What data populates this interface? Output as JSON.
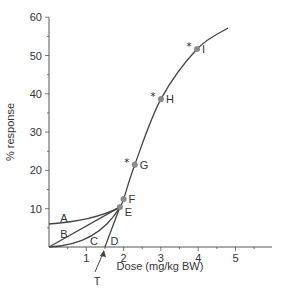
{
  "chart_data": {
    "type": "line",
    "title": "",
    "xlabel": "Dose (mg/kg BW)",
    "ylabel": "% response",
    "xlim": [
      0,
      6
    ],
    "ylim": [
      0,
      60
    ],
    "x_ticks": [
      1,
      2,
      3,
      4,
      5
    ],
    "x_minor_step": 0.5,
    "y_ticks": [
      10,
      20,
      30,
      40,
      50,
      60
    ],
    "y_minor_step": 5,
    "grid": false,
    "series": [
      {
        "name": "Main dose-response curve",
        "points": [
          {
            "x": 1.9,
            "y": 10.4
          },
          {
            "x": 2.0,
            "y": 12.5
          },
          {
            "x": 2.3,
            "y": 21.5
          },
          {
            "x": 3.0,
            "y": 38.6
          },
          {
            "x": 3.97,
            "y": 51.7
          },
          {
            "x": 4.8,
            "y": 57.2
          }
        ]
      },
      {
        "name": "A",
        "label": "A",
        "start": {
          "x": 0,
          "y": 6
        },
        "end": {
          "x": 1.9,
          "y": 10.4
        },
        "shape": "concave-up-slight",
        "label_pos": {
          "x": 0.3,
          "y": 7.5
        }
      },
      {
        "name": "B",
        "label": "B",
        "start": {
          "x": 0,
          "y": 0
        },
        "end": {
          "x": 1.9,
          "y": 10.4
        },
        "shape": "linear",
        "label_pos": {
          "x": 0.3,
          "y": 3.3
        }
      },
      {
        "name": "C",
        "label": "C",
        "start": {
          "x": 0,
          "y": 0
        },
        "end": {
          "x": 1.9,
          "y": 10.4
        },
        "shape": "concave-up",
        "label_pos": {
          "x": 1.1,
          "y": 1.5
        }
      },
      {
        "name": "D",
        "label": "D",
        "start": {
          "x": 1.5,
          "y": 0
        },
        "end": {
          "x": 1.9,
          "y": 10.4
        },
        "shape": "linear",
        "label_pos": {
          "x": 1.65,
          "y": 1.5
        }
      }
    ],
    "labeled_points": [
      {
        "label": "E",
        "x": 1.9,
        "y": 10.4,
        "starred": false
      },
      {
        "label": "F",
        "x": 2.0,
        "y": 12.5,
        "starred": false
      },
      {
        "label": "G",
        "x": 2.3,
        "y": 21.5,
        "starred": true
      },
      {
        "label": "H",
        "x": 3.0,
        "y": 38.6,
        "starred": true
      },
      {
        "label": "I",
        "x": 3.97,
        "y": 51.7,
        "starred": true
      }
    ],
    "annotations": [
      {
        "text": "T",
        "meaning": "threshold arrow",
        "points_to": {
          "x": 1.5,
          "y": 0
        }
      }
    ],
    "colors": {
      "line": "#444444",
      "point": "#8c8c8c",
      "axis": "#555555",
      "text": "#333333"
    }
  },
  "labels": {
    "x_axis_title": "Dose (mg/kg BW)",
    "y_axis_title": "% response",
    "threshold": "T",
    "star": "*"
  }
}
